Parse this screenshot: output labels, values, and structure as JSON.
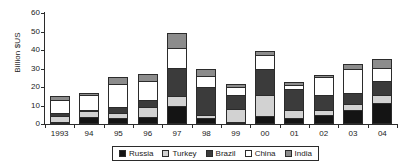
{
  "chart_data": {
    "type": "bar",
    "stacked": true,
    "title": "",
    "xlabel": "",
    "ylabel": "Billion $US",
    "ylim": [
      0,
      60
    ],
    "yticks": [
      0,
      10,
      20,
      30,
      40,
      50,
      60
    ],
    "grid": false,
    "legend_position": "bottom",
    "categories": [
      "1993",
      "94",
      "95",
      "96",
      "97",
      "98",
      "99",
      "00",
      "01",
      "02",
      "03",
      "04"
    ],
    "series": [
      {
        "name": "Russia",
        "color": "#141414",
        "values": [
          1.0,
          4.0,
          3.0,
          4.0,
          10.0,
          3.0,
          0.5,
          4.5,
          3.0,
          5.0,
          7.5,
          11.5
        ]
      },
      {
        "name": "Turkey",
        "color": "#d2d2d2",
        "values": [
          3.5,
          3.0,
          3.0,
          5.0,
          5.0,
          2.0,
          7.0,
          11.0,
          4.5,
          2.5,
          3.5,
          4.0
        ]
      },
      {
        "name": "Brazil",
        "color": "#3b3b3b",
        "values": [
          1.5,
          0.5,
          3.0,
          4.0,
          15.5,
          15.0,
          7.5,
          14.5,
          11.5,
          8.0,
          5.5,
          8.0
        ]
      },
      {
        "name": "China",
        "color": "#ffffff",
        "values": [
          7.0,
          8.0,
          12.5,
          10.5,
          10.5,
          6.0,
          4.5,
          7.5,
          2.0,
          10.0,
          13.5,
          7.0
        ]
      },
      {
        "name": "India",
        "color": "#8c8c8c",
        "values": [
          2.0,
          1.5,
          4.0,
          3.5,
          8.0,
          3.5,
          1.5,
          2.0,
          1.5,
          1.0,
          2.5,
          4.5
        ]
      }
    ]
  }
}
